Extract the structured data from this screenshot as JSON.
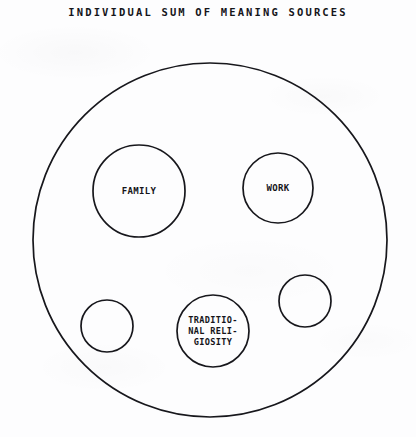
{
  "title": "INDIVIDUAL SUM OF MEANING SOURCES",
  "colors": {
    "background": "#fdfdfe",
    "stroke": "#17171c",
    "text": "#15151a"
  },
  "chart_data": {
    "type": "diagram",
    "diagram_kind": "venn-set-containment",
    "title": "INDIVIDUAL SUM OF MEANING SOURCES",
    "xlabel": "",
    "ylabel": "",
    "grid": false,
    "legend": false,
    "canvas": {
      "width": 416,
      "height": 437
    },
    "container": {
      "name": "individual-sum-of-meaning-sources",
      "label": "",
      "cx": 210,
      "cy": 240,
      "r": 177,
      "stroke_width": 1.7
    },
    "nodes": [
      {
        "id": "family",
        "label": "FAMILY",
        "lines": [
          "FAMILY"
        ],
        "cx": 139,
        "cy": 191,
        "r": 46,
        "font_size": 9,
        "stroke_width": 1.7
      },
      {
        "id": "work",
        "label": "WORK",
        "lines": [
          "WORK"
        ],
        "cx": 278,
        "cy": 188,
        "r": 35,
        "font_size": 9,
        "stroke_width": 1.7
      },
      {
        "id": "traditional-religiosity",
        "label": "TRADITIONAL RELIGIOSITY",
        "lines": [
          "TRADITIO-",
          "NAL RELI-",
          "GIOSITY"
        ],
        "cx": 213,
        "cy": 331,
        "r": 36,
        "font_size": 8.6,
        "line_height": 11,
        "stroke_width": 1.7
      },
      {
        "id": "unlabeled-left",
        "label": "",
        "lines": [],
        "cx": 107,
        "cy": 326,
        "r": 26,
        "font_size": 9,
        "stroke_width": 1.7
      },
      {
        "id": "unlabeled-right",
        "label": "",
        "lines": [],
        "cx": 305,
        "cy": 301,
        "r": 26,
        "font_size": 9,
        "stroke_width": 1.7
      }
    ]
  }
}
